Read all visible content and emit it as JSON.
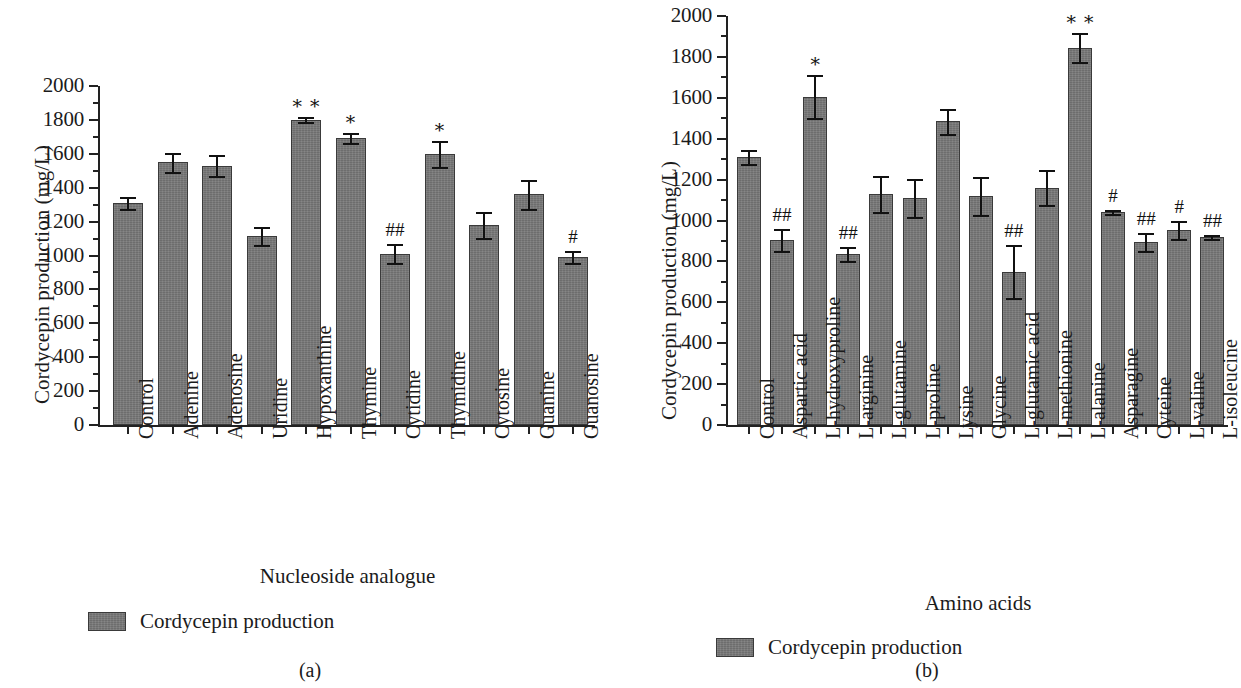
{
  "figure": {
    "panels": [
      {
        "id": "a",
        "caption": "(a)",
        "ylabel": "Cordycepin production (mg/L)",
        "xlabel": "Nucleoside analogue",
        "legend_label": "Cordycepin production",
        "bar_color": "#787878"
      },
      {
        "id": "b",
        "caption": "(b)",
        "ylabel": "Cordycepin production (mg/L)",
        "xlabel": "Amino acids",
        "legend_label": "Cordycepin production",
        "bar_color": "#787878"
      }
    ]
  },
  "chart_data": [
    {
      "type": "bar",
      "panel": "a",
      "title": "",
      "xlabel": "Nucleoside analogue",
      "ylabel": "Cordycepin production (mg/L)",
      "ylim": [
        0,
        2000
      ],
      "ytick_step": 200,
      "yminor_step": 100,
      "grid": false,
      "legend": [
        "Cordycepin production"
      ],
      "legend_position": "below-axis-left",
      "categories": [
        "Control",
        "Adenine",
        "Adenosine",
        "Uridine",
        "Hypoxanthine",
        "Thymine",
        "Cytidine",
        "Thymidine",
        "Cytosine",
        "Guanine",
        "Guanosine"
      ],
      "values": [
        1310,
        1550,
        1530,
        1115,
        1800,
        1695,
        1010,
        1600,
        1180,
        1360,
        990
      ],
      "errors": [
        35,
        55,
        60,
        55,
        15,
        30,
        55,
        75,
        75,
        85,
        35
      ],
      "yticks": [
        0,
        200,
        400,
        600,
        800,
        1000,
        1200,
        1400,
        1600,
        1800,
        2000
      ],
      "annotations": [
        "",
        "",
        "",
        "",
        "∗ ∗",
        "∗",
        "##",
        "∗",
        "",
        "",
        "#"
      ]
    },
    {
      "type": "bar",
      "panel": "b",
      "title": "",
      "xlabel": "Amino acids",
      "ylabel": "Cordycepin production (mg/L)",
      "ylim": [
        0,
        2000
      ],
      "ytick_step": 200,
      "yminor_step": 100,
      "grid": false,
      "legend": [
        "Cordycepin production"
      ],
      "legend_position": "below-axis-left",
      "categories": [
        "Control",
        "Aspartic acid",
        "L-hydroxyproline",
        "L-arginine",
        "L-glutamine",
        "L-proline",
        "Lysine",
        "Glycine",
        "L-glutamic acid",
        "L-methionine",
        "L-alanine",
        "Asparagine",
        "Cyteine",
        "L-valine",
        "L-isoleucine"
      ],
      "values": [
        1310,
        905,
        1605,
        835,
        1130,
        1110,
        1485,
        1120,
        750,
        1160,
        1845,
        1040,
        895,
        955,
        920
      ],
      "errors": [
        35,
        55,
        105,
        35,
        90,
        95,
        60,
        95,
        130,
        85,
        70,
        10,
        45,
        45,
        10
      ],
      "yticks": [
        0,
        200,
        400,
        600,
        800,
        1000,
        1200,
        1400,
        1600,
        1800,
        2000
      ],
      "annotations": [
        "",
        "##",
        "∗",
        "##",
        "",
        "",
        "",
        "",
        "##",
        "",
        "∗ ∗",
        "#",
        "##",
        "#",
        "##"
      ]
    }
  ]
}
